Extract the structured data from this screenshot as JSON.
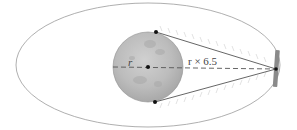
{
  "diagram": {
    "type": "orbit-geometry",
    "labels": {
      "radius": "r",
      "distance": "r × 6.5"
    },
    "colors": {
      "orbit": "#9a9a9a",
      "body": "#b8b8b8",
      "body_edge": "#8f8f8f",
      "lines": "#555555",
      "dashed": "#555555",
      "dots": "#111111",
      "satellite": "#8a8a8a",
      "hatch": "#c8c8c8"
    }
  }
}
